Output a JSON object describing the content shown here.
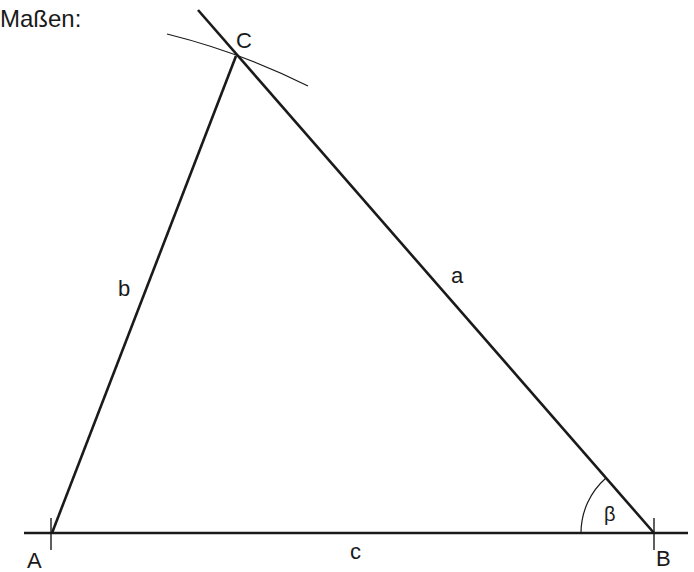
{
  "title": "Maßen:",
  "diagram": {
    "type": "triangle-construction",
    "vertices": {
      "A": {
        "label": "A",
        "x": 52,
        "y": 533
      },
      "B": {
        "label": "B",
        "x": 654,
        "y": 533
      },
      "C": {
        "label": "C",
        "x": 236,
        "y": 56
      }
    },
    "sides": {
      "a": {
        "label": "a",
        "from": "B",
        "to": "C"
      },
      "b": {
        "label": "b",
        "from": "A",
        "to": "C"
      },
      "c": {
        "label": "c",
        "from": "A",
        "to": "B"
      }
    },
    "angle": {
      "label": "β",
      "vertex": "B"
    },
    "construction": [
      "extended baseline through A and B with tick marks",
      "ray from B through C extended beyond C",
      "compass arc through C"
    ]
  },
  "labels": {
    "A": "A",
    "B": "B",
    "C": "C",
    "a": "a",
    "b": "b",
    "c": "c",
    "beta": "β"
  },
  "colors": {
    "stroke": "#1a1a1a",
    "background": "#ffffff"
  }
}
